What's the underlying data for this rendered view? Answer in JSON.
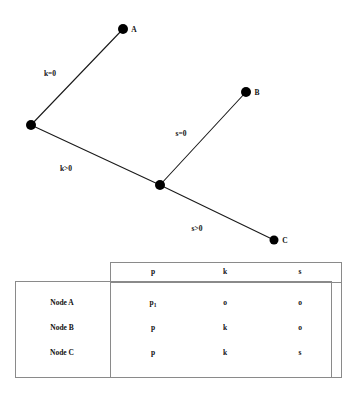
{
  "figure": {
    "title": "",
    "graph": {
      "nodes": [
        {
          "id": "root",
          "label": "",
          "x": 31,
          "y": 125,
          "r": 5.0,
          "color": "#000000"
        },
        {
          "id": "A",
          "label": "A",
          "x": 123,
          "y": 29,
          "r": 5.0,
          "color": "#000000"
        },
        {
          "id": "mid",
          "label": "",
          "x": 160,
          "y": 185,
          "r": 5.0,
          "color": "#000000"
        },
        {
          "id": "B",
          "label": "B",
          "x": 246,
          "y": 92,
          "r": 5.0,
          "color": "#000000"
        },
        {
          "id": "C",
          "label": "C",
          "x": 274,
          "y": 240,
          "r": 4.5,
          "color": "#000000"
        }
      ],
      "edges": [
        {
          "from": "root",
          "to": "A",
          "label": "k=0",
          "label_x": 50,
          "label_y": 76
        },
        {
          "from": "root",
          "to": "mid",
          "label": "k>0",
          "label_x": 66,
          "label_y": 171
        },
        {
          "from": "mid",
          "to": "B",
          "label": "s=0",
          "label_x": 181,
          "label_y": 136
        },
        {
          "from": "mid",
          "to": "C",
          "label": "s>0",
          "label_x": 197,
          "label_y": 231
        }
      ],
      "line_color": "#1a1a1a",
      "line_width": 1.1
    },
    "table": {
      "border_color": "#8a8a8a",
      "outer_box": {
        "x": 15,
        "y": 281,
        "w": 316,
        "h": 96
      },
      "inner_box": {
        "x": 110,
        "y": 262,
        "w": 231,
        "h": 115
      },
      "header_rule_y": 282,
      "row_label_x": 62,
      "col_x": [
        153,
        225,
        300
      ],
      "header_y": 274,
      "row_y": [
        305,
        330,
        355
      ],
      "columns": [
        "p",
        "k",
        "s"
      ],
      "rows": [
        {
          "label": "Node A",
          "cells": [
            {
              "text": "p",
              "sub": "1"
            },
            {
              "text": "o",
              "sub": ""
            },
            {
              "text": "o",
              "sub": ""
            }
          ]
        },
        {
          "label": "Node B",
          "cells": [
            {
              "text": "p",
              "sub": ""
            },
            {
              "text": "k",
              "sub": ""
            },
            {
              "text": "o",
              "sub": ""
            }
          ]
        },
        {
          "label": "Node C",
          "cells": [
            {
              "text": "p",
              "sub": ""
            },
            {
              "text": "k",
              "sub": ""
            },
            {
              "text": "s",
              "sub": ""
            }
          ]
        }
      ]
    }
  }
}
